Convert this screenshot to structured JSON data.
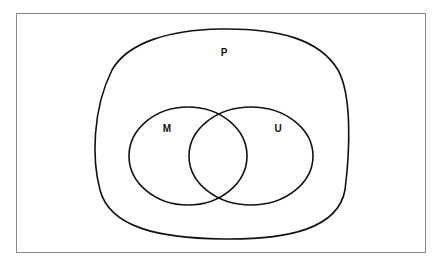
{
  "diagram": {
    "type": "venn",
    "sets": [
      {
        "id": "P",
        "label": "P",
        "role": "universal / outer set"
      },
      {
        "id": "M",
        "label": "M",
        "role": "subset of P"
      },
      {
        "id": "U",
        "label": "U",
        "role": "subset of P"
      }
    ],
    "relations": [
      {
        "type": "subset",
        "child": "M",
        "parent": "P"
      },
      {
        "type": "subset",
        "child": "U",
        "parent": "P"
      },
      {
        "type": "overlap",
        "sets": [
          "M",
          "U"
        ]
      }
    ],
    "colors": {
      "stroke": "#111111",
      "border": "#8a8a8a",
      "background": "#ffffff"
    }
  }
}
